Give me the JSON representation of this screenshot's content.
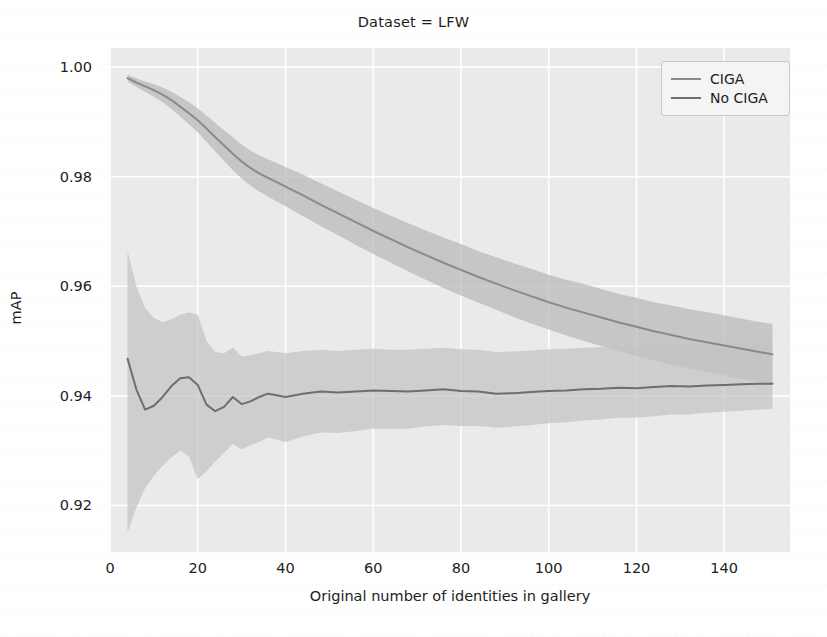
{
  "chart_data": {
    "type": "line",
    "title": "Dataset = LFW",
    "xlabel": "Original number of identities in gallery",
    "ylabel": "mAP",
    "xlim": [
      0,
      155
    ],
    "ylim": [
      0.9115,
      1.0035
    ],
    "grid": true,
    "legend_position": "upper right",
    "xticks": [
      0,
      20,
      40,
      60,
      80,
      100,
      120,
      140
    ],
    "xtick_labels": [
      "0",
      "20",
      "40",
      "60",
      "80",
      "100",
      "120",
      "140"
    ],
    "yticks": [
      0.92,
      0.94,
      0.96,
      0.98,
      1.0
    ],
    "ytick_labels": [
      "0.92",
      "0.94",
      "0.96",
      "0.98",
      "1.00"
    ],
    "band_type": "confidence interval (shaded)",
    "colors": {
      "ciga_line": "#8a8a8a",
      "no_ciga_line": "#6e6e6e",
      "ciga_band": "#b9b9b9",
      "no_ciga_band": "#c3c3c3",
      "plot_background": "#eaeaea",
      "gridline": "#ffffff"
    },
    "x": [
      4,
      6,
      8,
      10,
      12,
      14,
      16,
      18,
      20,
      22,
      24,
      26,
      28,
      30,
      32,
      34,
      36,
      38,
      40,
      44,
      48,
      52,
      56,
      60,
      64,
      68,
      72,
      76,
      80,
      84,
      88,
      92,
      96,
      100,
      104,
      108,
      112,
      116,
      120,
      124,
      128,
      132,
      136,
      140,
      144,
      148,
      151
    ],
    "series": [
      {
        "name": "CIGA",
        "values": [
          0.998,
          0.9972,
          0.9965,
          0.9958,
          0.995,
          0.994,
          0.9928,
          0.9916,
          0.9903,
          0.9888,
          0.9872,
          0.9857,
          0.9842,
          0.9828,
          0.9816,
          0.9806,
          0.9798,
          0.979,
          0.9782,
          0.9766,
          0.9749,
          0.9733,
          0.9717,
          0.9701,
          0.9686,
          0.9671,
          0.9657,
          0.9643,
          0.963,
          0.9617,
          0.9605,
          0.9593,
          0.9582,
          0.9571,
          0.9561,
          0.9552,
          0.9543,
          0.9534,
          0.9526,
          0.9518,
          0.9511,
          0.9504,
          0.9498,
          0.9492,
          0.9486,
          0.948,
          0.9476
        ],
        "band_lower": [
          0.9974,
          0.9964,
          0.9955,
          0.9946,
          0.9936,
          0.9924,
          0.991,
          0.9896,
          0.9881,
          0.9864,
          0.9846,
          0.9829,
          0.9812,
          0.9797,
          0.9784,
          0.9773,
          0.9764,
          0.9755,
          0.9746,
          0.9728,
          0.971,
          0.9693,
          0.9676,
          0.9659,
          0.9643,
          0.9627,
          0.9612,
          0.9597,
          0.9583,
          0.957,
          0.9557,
          0.9544,
          0.9532,
          0.9521,
          0.951,
          0.95,
          0.9491,
          0.9482,
          0.9473,
          0.9465,
          0.9457,
          0.945,
          0.9443,
          0.9437,
          0.9431,
          0.9425,
          0.9421
        ],
        "band_upper": [
          0.9986,
          0.998,
          0.9974,
          0.9969,
          0.9963,
          0.9955,
          0.9946,
          0.9936,
          0.9925,
          0.9912,
          0.9898,
          0.9885,
          0.9872,
          0.9859,
          0.9848,
          0.9839,
          0.9832,
          0.9825,
          0.9818,
          0.9804,
          0.9788,
          0.9773,
          0.9758,
          0.9743,
          0.9729,
          0.9715,
          0.9702,
          0.9689,
          0.9677,
          0.9664,
          0.9653,
          0.9642,
          0.9632,
          0.9621,
          0.9612,
          0.9604,
          0.9595,
          0.9586,
          0.9579,
          0.9571,
          0.9565,
          0.9558,
          0.9553,
          0.9547,
          0.9541,
          0.9535,
          0.9531
        ]
      },
      {
        "name": "No CIGA",
        "values": [
          0.9468,
          0.9412,
          0.9375,
          0.9382,
          0.9398,
          0.9418,
          0.9432,
          0.9434,
          0.942,
          0.9384,
          0.9372,
          0.938,
          0.9398,
          0.9385,
          0.939,
          0.9398,
          0.9404,
          0.9401,
          0.9398,
          0.9404,
          0.9408,
          0.9406,
          0.9408,
          0.941,
          0.9409,
          0.9408,
          0.941,
          0.9412,
          0.9409,
          0.9408,
          0.9404,
          0.9405,
          0.9407,
          0.9409,
          0.941,
          0.9412,
          0.9413,
          0.9415,
          0.9414,
          0.9416,
          0.9418,
          0.9417,
          0.9419,
          0.942,
          0.9421,
          0.9422,
          0.9422
        ],
        "band_lower": [
          0.915,
          0.9196,
          0.9232,
          0.9254,
          0.9272,
          0.9288,
          0.93,
          0.929,
          0.9248,
          0.9262,
          0.928,
          0.9296,
          0.9312,
          0.9302,
          0.931,
          0.9316,
          0.9324,
          0.932,
          0.9316,
          0.9326,
          0.9333,
          0.9332,
          0.9336,
          0.934,
          0.934,
          0.934,
          0.9344,
          0.9347,
          0.9345,
          0.9345,
          0.9342,
          0.9344,
          0.9347,
          0.935,
          0.9352,
          0.9355,
          0.9357,
          0.936,
          0.936,
          0.9363,
          0.9366,
          0.9366,
          0.9369,
          0.9371,
          0.9373,
          0.9375,
          0.9376
        ],
        "band_upper": [
          0.9665,
          0.96,
          0.956,
          0.9542,
          0.9535,
          0.954,
          0.9548,
          0.9552,
          0.9548,
          0.95,
          0.948,
          0.9478,
          0.9488,
          0.9472,
          0.9474,
          0.9478,
          0.9482,
          0.948,
          0.9478,
          0.9482,
          0.9484,
          0.9482,
          0.9484,
          0.9486,
          0.9484,
          0.9484,
          0.9486,
          0.9488,
          0.9485,
          0.9484,
          0.948,
          0.9481,
          0.9483,
          0.9485,
          0.9486,
          0.9488,
          0.9489,
          0.9491,
          0.949,
          0.9492,
          0.9494,
          0.9493,
          0.9495,
          0.9496,
          0.9497,
          0.9498,
          0.9498
        ]
      }
    ]
  },
  "legend": {
    "entries": [
      {
        "label": "CIGA",
        "color": "#8a8a8a"
      },
      {
        "label": "No CIGA",
        "color": "#6e6e6e"
      }
    ]
  }
}
